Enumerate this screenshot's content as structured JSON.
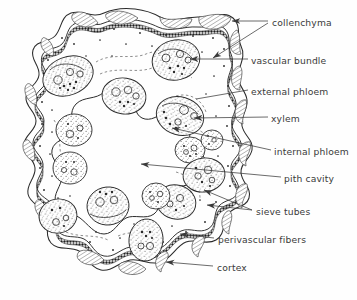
{
  "figure": {
    "type": "botanical-line-drawing",
    "background_color": "#fefefe",
    "ink_color": "#2b2b2b",
    "text_color": "#3a3a3a"
  },
  "labels": [
    {
      "id": "collenchyma",
      "text": "collenchyma",
      "x": 272,
      "y": 23,
      "arrows": 2,
      "pointer": "arrowhead"
    },
    {
      "id": "vascular-bundle",
      "text": "vascular bundle",
      "x": 251,
      "y": 61,
      "arrows": 1,
      "pointer": "arrowhead"
    },
    {
      "id": "external-phloem",
      "text": "external phloem",
      "x": 251,
      "y": 92,
      "arrows": 1,
      "pointer": "line"
    },
    {
      "id": "xylem",
      "text": "xylem",
      "x": 271,
      "y": 119,
      "arrows": 1,
      "pointer": "arrowhead"
    },
    {
      "id": "internal-phloem",
      "text": "internal phloem",
      "x": 274,
      "y": 152,
      "arrows": 1,
      "pointer": "arrowhead"
    },
    {
      "id": "pith-cavity",
      "text": "pith cavity",
      "x": 284,
      "y": 179,
      "arrows": 1,
      "pointer": "arrowhead"
    },
    {
      "id": "sieve-tubes",
      "text": "sieve tubes",
      "x": 256,
      "y": 212,
      "arrows": 2,
      "pointer": "arrowhead"
    },
    {
      "id": "perivascular-fibers",
      "text": "perivascular fibers",
      "x": 218,
      "y": 240,
      "arrows": 1,
      "pointer": "arrowhead"
    },
    {
      "id": "cortex",
      "text": "cortex",
      "x": 217,
      "y": 268,
      "arrows": 1,
      "pointer": "arrowhead"
    }
  ],
  "anatomy": {
    "outer_boundary": "wavy lobed epidermis outline",
    "collenchyma_patches": 14,
    "perivascular_fiber_ring": "dark beaded band just inside cortex",
    "cortex": "pale zone between epidermis and fiber ring",
    "pith_cavity": "large irregular hollow center",
    "vascular_bundles": 14,
    "bundle_parts": [
      "external phloem",
      "xylem",
      "internal phloem",
      "sieve tubes"
    ]
  }
}
